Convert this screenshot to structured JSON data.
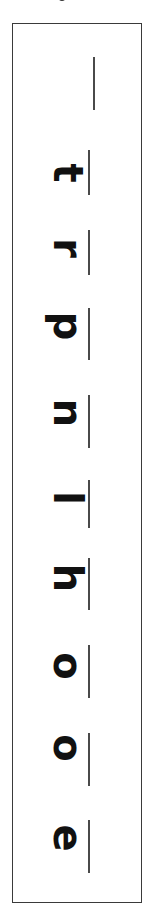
{
  "worksheet": {
    "orientation": "rotated-90",
    "reading_direction": "bottom-to-top",
    "letters": [
      {
        "char": "t",
        "top": 165,
        "line_top": 150,
        "line_bottom": 195
      },
      {
        "char": "r",
        "top": 240,
        "line_top": 230,
        "line_bottom": 275
      },
      {
        "char": "p",
        "top": 318,
        "line_top": 308,
        "line_bottom": 360
      },
      {
        "char": "n",
        "top": 405,
        "line_top": 395,
        "line_bottom": 448
      },
      {
        "char": "l",
        "top": 490,
        "line_top": 480,
        "line_bottom": 528
      },
      {
        "char": "h",
        "top": 570,
        "line_top": 558,
        "line_bottom": 610
      },
      {
        "char": "o",
        "top": 658,
        "line_top": 645,
        "line_bottom": 698
      },
      {
        "char": "o",
        "top": 740,
        "line_top": 733,
        "line_bottom": 786
      },
      {
        "char": "e",
        "top": 830,
        "line_top": 820,
        "line_bottom": 873
      }
    ],
    "top_line": {
      "top": 57,
      "bottom": 110
    },
    "colors": {
      "ink": "#111111",
      "line": "#4a4a4a",
      "frame": "#3a3a3a"
    }
  }
}
